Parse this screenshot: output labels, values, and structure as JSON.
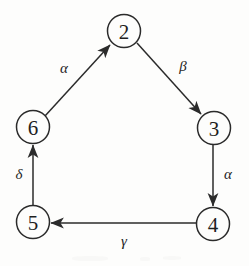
{
  "figure": {
    "kind": "directed-graph",
    "background_color": "#fdfdfc",
    "ink_color": "#2b2b2b",
    "width": 249,
    "height": 266
  },
  "nodes": [
    {
      "id": "2",
      "label": "2",
      "cx": 124,
      "cy": 31,
      "r": 16.5,
      "name": "node-2"
    },
    {
      "id": "6",
      "label": "6",
      "cx": 33,
      "cy": 127,
      "r": 16.5,
      "name": "node-6"
    },
    {
      "id": "3",
      "label": "3",
      "cx": 214,
      "cy": 128,
      "r": 16.5,
      "name": "node-3"
    },
    {
      "id": "5",
      "label": "5",
      "cx": 33,
      "cy": 222,
      "r": 16.5,
      "name": "node-5"
    },
    {
      "id": "4",
      "label": "4",
      "cx": 213,
      "cy": 224,
      "r": 16.5,
      "name": "node-4"
    }
  ],
  "edges": [
    {
      "id": "e-6-2",
      "from": "6",
      "to": "2",
      "label": "α",
      "label_name": "alpha",
      "label_x": 64,
      "label_y": 68,
      "x1": 45,
      "y1": 116,
      "x2": 110,
      "y2": 45
    },
    {
      "id": "e-2-3",
      "from": "2",
      "to": "3",
      "label": "β",
      "label_name": "beta",
      "label_x": 183,
      "label_y": 66,
      "x1": 137,
      "y1": 43,
      "x2": 201,
      "y2": 114
    },
    {
      "id": "e-3-4",
      "from": "3",
      "to": "4",
      "label": "α",
      "label_name": "alpha",
      "label_x": 228,
      "label_y": 174,
      "x1": 213,
      "y1": 145,
      "x2": 213,
      "y2": 206
    },
    {
      "id": "e-4-5",
      "from": "4",
      "to": "5",
      "label": "γ",
      "label_name": "gamma",
      "label_x": 124,
      "label_y": 241,
      "x1": 196,
      "y1": 223,
      "x2": 51,
      "y2": 223
    },
    {
      "id": "e-5-6",
      "from": "5",
      "to": "6",
      "label": "δ",
      "label_name": "delta",
      "label_x": 19,
      "label_y": 174,
      "x1": 33,
      "y1": 205,
      "x2": 33,
      "y2": 145
    }
  ]
}
